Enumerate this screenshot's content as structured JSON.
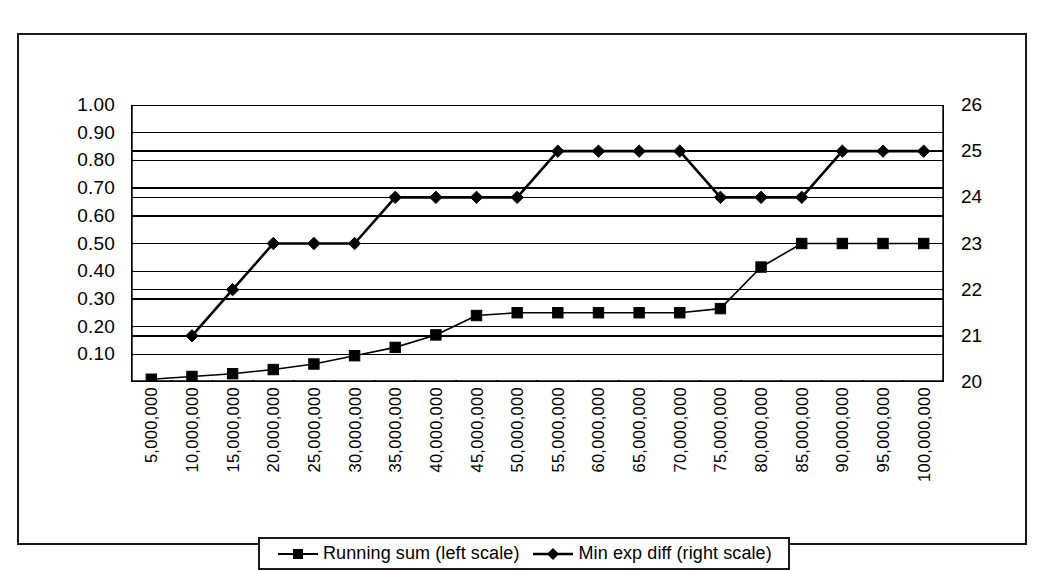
{
  "chart_data": {
    "type": "line",
    "title": "",
    "xlabel": "",
    "ylabel": "",
    "grid": true,
    "legend_position": "bottom",
    "categories": [
      "5,000,000",
      "10,000,000",
      "15,000,000",
      "20,000,000",
      "25,000,000",
      "30,000,000",
      "35,000,000",
      "40,000,000",
      "45,000,000",
      "50,000,000",
      "55,000,000",
      "60,000,000",
      "65,000,000",
      "70,000,000",
      "75,000,000",
      "80,000,000",
      "85,000,000",
      "90,000,000",
      "95,000,000",
      "100,000,000"
    ],
    "x": [
      5000000,
      10000000,
      15000000,
      20000000,
      25000000,
      30000000,
      35000000,
      40000000,
      45000000,
      50000000,
      55000000,
      60000000,
      65000000,
      70000000,
      75000000,
      80000000,
      85000000,
      90000000,
      95000000,
      100000000
    ],
    "series": [
      {
        "name": "Running sum (left scale)",
        "axis": "left",
        "marker": "square",
        "values": [
          0.01,
          0.02,
          0.03,
          0.045,
          0.065,
          0.095,
          0.125,
          0.17,
          0.24,
          0.25,
          0.25,
          0.25,
          0.25,
          0.25,
          0.265,
          0.415,
          0.5,
          0.5,
          0.5,
          0.5
        ]
      },
      {
        "name": "Min exp diff (right scale)",
        "axis": "right",
        "marker": "diamond",
        "values": [
          null,
          21,
          22,
          23,
          23,
          23,
          24,
          24,
          24,
          24,
          25,
          25,
          25,
          25,
          24,
          24,
          24,
          25,
          25,
          25
        ]
      }
    ],
    "y_left": {
      "label": "",
      "min": 0.0,
      "max": 1.0,
      "ticks": [
        0.0,
        0.1,
        0.2,
        0.3,
        0.4,
        0.5,
        0.6,
        0.7,
        0.8,
        0.9,
        1.0
      ],
      "tick_labels": [
        "",
        "0.10",
        "0.20",
        "0.30",
        "0.40",
        "0.50",
        "0.60",
        "0.70",
        "0.80",
        "0.90",
        "1.00"
      ]
    },
    "y_right": {
      "label": "",
      "min": 20,
      "max": 26,
      "ticks": [
        20,
        21,
        22,
        23,
        24,
        25,
        26
      ],
      "tick_labels": [
        "20",
        "21",
        "22",
        "23",
        "24",
        "25",
        "26"
      ]
    },
    "colors": {
      "line": "#000000",
      "grid": "#000000",
      "axis": "#000000",
      "background": "#ffffff",
      "frame": "#1a1a1a"
    }
  },
  "legend": {
    "items": [
      {
        "label": "Running sum (left scale)",
        "marker": "square"
      },
      {
        "label": "Min exp diff (right scale)",
        "marker": "diamond"
      }
    ]
  }
}
